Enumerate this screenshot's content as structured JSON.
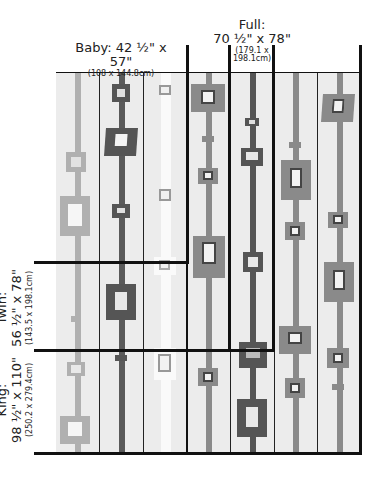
{
  "colors": {
    "background": "#ececec",
    "light_gray": "#a8a8a8",
    "mid_gray": "#8a8a8a",
    "dark_gray": "#555555",
    "white_stripe": "#fafafa",
    "frame": "#111111"
  },
  "sizes": {
    "baby": {
      "name": "Baby:",
      "imperial": "42 ½\" x 57\"",
      "metric": "(108 x 144.8cm)"
    },
    "full": {
      "name": "Full:",
      "imperial": "70 ½\" x 78\"",
      "metric_line1": "(179.1 x",
      "metric_line2": "198.1cm)"
    },
    "twin": {
      "name": "Twin:",
      "imperial": "56 ½\" x 78\"",
      "metric": "(143.5 x 198.1cm)"
    },
    "king": {
      "name": "King:",
      "imperial": "98 ½\" x 110\"",
      "metric": "(250.2 x 279.4cm)"
    }
  },
  "quilt": {
    "columns": 7,
    "column_stripes": [
      "light",
      "dark",
      "white",
      "mid",
      "dark",
      "mid",
      "mid"
    ]
  }
}
